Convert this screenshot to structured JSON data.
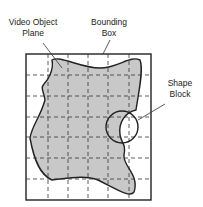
{
  "labels": {
    "vop": [
      "Video Object",
      "Plane"
    ],
    "bbox": [
      "Bounding",
      "Box"
    ],
    "shape": [
      "Shape",
      "Block"
    ]
  },
  "colors": {
    "fill": "#c8c8c8",
    "stroke": "#222222",
    "grid": "#333333"
  },
  "grid": {
    "columns": 6,
    "rows": 7
  }
}
